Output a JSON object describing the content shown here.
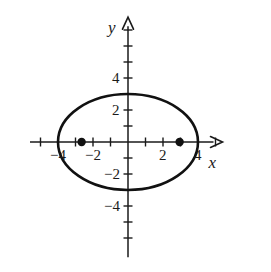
{
  "figure": {
    "background_color": "#ffffff",
    "ink_color": "#1a1a1a",
    "width": 271,
    "height": 272
  },
  "axes": {
    "x_axis_label": "x",
    "y_axis_label": "y",
    "x_label_name": "x-axis-label",
    "y_label_name": "y-axis-label",
    "origin_px": {
      "x": 128,
      "y": 142
    },
    "unit_px": {
      "x": 17.5,
      "y": 16
    },
    "x_range": [
      -5.6,
      5.4
    ],
    "y_range": [
      -7.2,
      7.8
    ],
    "grid": false,
    "x_ticks": [
      -5,
      -4,
      -3,
      -2,
      -1,
      1,
      2,
      3,
      4,
      5
    ],
    "y_ticks": [
      -6,
      -5,
      -4,
      -3,
      -2,
      -1,
      1,
      2,
      3,
      4,
      5,
      6,
      7
    ],
    "x_tick_labels": [
      {
        "value": -4,
        "text": "−4"
      },
      {
        "value": -2,
        "text": "−2"
      },
      {
        "value": 2,
        "text": "2"
      },
      {
        "value": 4,
        "text": "4"
      }
    ],
    "y_tick_labels": [
      {
        "value": 4,
        "text": "4"
      },
      {
        "value": 2,
        "text": "2"
      },
      {
        "value": -2,
        "text": "−2"
      },
      {
        "value": -4,
        "text": "−4"
      }
    ]
  },
  "chart_data": {
    "type": "scatter",
    "title": "",
    "xlabel": "x",
    "ylabel": "y",
    "xlim": [
      -5.6,
      5.4
    ],
    "ylim": [
      -7.2,
      7.8
    ],
    "grid": false,
    "legend": "none",
    "curves": [
      {
        "name": "ellipse",
        "shape": "ellipse",
        "center": [
          0,
          0
        ],
        "semi_major_axis_a": 4,
        "semi_minor_axis_b": 3,
        "orientation": "horizontal",
        "equation": "x^2/16 + y^2/9 = 1",
        "stroke_width": 2.6,
        "color": "#111111"
      }
    ],
    "points": [
      {
        "name": "focus-left",
        "x": -2.65,
        "y": 0,
        "marker": "filled-circle",
        "radius_px": 4.2,
        "color": "#111111"
      },
      {
        "name": "focus-right",
        "x": 2.95,
        "y": 0,
        "marker": "filled-circle",
        "radius_px": 4.2,
        "color": "#111111"
      }
    ],
    "annotations": []
  }
}
